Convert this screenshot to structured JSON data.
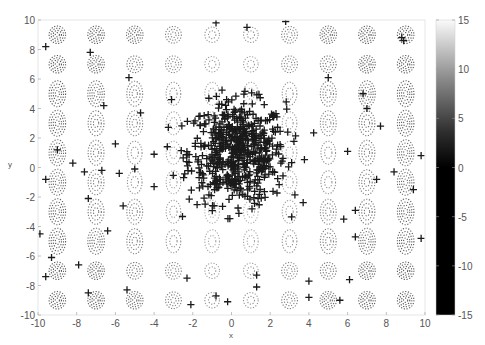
{
  "chart_data": {
    "type": "scatter",
    "subtype": "contour with scatter overlay",
    "title": "",
    "xlabel": "x",
    "ylabel": "y",
    "xlim": [
      -10,
      10
    ],
    "ylim": [
      -10,
      10
    ],
    "x_ticks": [
      -10,
      -8,
      -6,
      -4,
      -2,
      0,
      2,
      4,
      6,
      8,
      10
    ],
    "y_ticks": [
      -10,
      -8,
      -6,
      -4,
      -2,
      0,
      2,
      4,
      6,
      8,
      10
    ],
    "grid": false,
    "legend": null,
    "colorbar": {
      "colormap": "gray",
      "range": [
        -15,
        15
      ],
      "ticks": [
        -15,
        -10,
        -5,
        0,
        5,
        10,
        15
      ]
    },
    "contour": {
      "style": "dotted",
      "description": "periodic egg-crate pattern of closed dotted contours, denser toward the left and right edges"
    },
    "series": [
      {
        "name": "samples",
        "marker": "+",
        "color": "#1a1a1a",
        "outliers": [
          [
            -9.6,
            8.2
          ],
          [
            -7.3,
            7.8
          ],
          [
            -9.6,
            -0.8
          ],
          [
            -8.2,
            0.3
          ],
          [
            -9.0,
            1.2
          ],
          [
            -7.6,
            -0.3
          ],
          [
            -7.4,
            -2.1
          ],
          [
            -6.7,
            -0.2
          ],
          [
            -5.8,
            -0.4
          ],
          [
            -5.0,
            -0.1
          ],
          [
            -4.0,
            0.9
          ],
          [
            -4.0,
            -1.3
          ],
          [
            -5.6,
            -2.6
          ],
          [
            -6.4,
            -4.3
          ],
          [
            -9.9,
            -4.5
          ],
          [
            -9.3,
            -6.1
          ],
          [
            -7.9,
            -6.6
          ],
          [
            -9.6,
            -7.4
          ],
          [
            -7.4,
            -8.5
          ],
          [
            -5.4,
            -8.3
          ],
          [
            -6.0,
            1.6
          ],
          [
            -4.7,
            3.7
          ],
          [
            -3.1,
            4.6
          ],
          [
            -5.3,
            6.1
          ],
          [
            -6.6,
            4.2
          ],
          [
            -0.8,
            9.8
          ],
          [
            2.8,
            9.9
          ],
          [
            0.8,
            9.5
          ],
          [
            8.8,
            8.8
          ],
          [
            8.9,
            8.6
          ],
          [
            5.0,
            6.1
          ],
          [
            6.8,
            5.0
          ],
          [
            7.0,
            4.0
          ],
          [
            7.7,
            2.8
          ],
          [
            9.8,
            0.8
          ],
          [
            6.0,
            1.1
          ],
          [
            7.5,
            -0.8
          ],
          [
            8.4,
            -0.3
          ],
          [
            9.4,
            -1.5
          ],
          [
            6.4,
            -2.9
          ],
          [
            5.8,
            -3.5
          ],
          [
            6.4,
            -4.7
          ],
          [
            6.1,
            -7.6
          ],
          [
            5.6,
            -9.0
          ],
          [
            9.8,
            -4.8
          ],
          [
            4.0,
            -7.7
          ],
          [
            4.0,
            -8.8
          ],
          [
            1.3,
            -8.1
          ],
          [
            1.3,
            -7.3
          ],
          [
            -0.2,
            -9.1
          ],
          [
            -2.1,
            -9.3
          ],
          [
            -2.3,
            -7.5
          ],
          [
            -0.8,
            -8.7
          ]
        ],
        "cluster": {
          "center": [
            0.3,
            1.0
          ],
          "approx_extent_x": [
            -2.5,
            3.0
          ],
          "approx_extent_y": [
            -3.0,
            5.0
          ],
          "approx_count": 600
        }
      }
    ]
  }
}
